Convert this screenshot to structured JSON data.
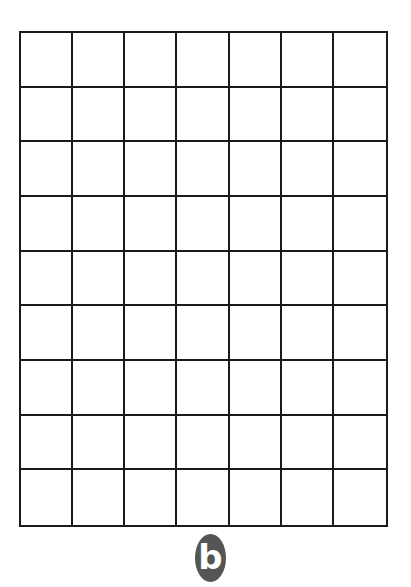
{
  "figure": {
    "type": "grid",
    "columns": 7,
    "rows": 9,
    "line_color": "#1a1a1a",
    "background": "#ffffff"
  },
  "label": {
    "text": "b",
    "badge_color": "#555555",
    "text_color": "#ffffff"
  }
}
